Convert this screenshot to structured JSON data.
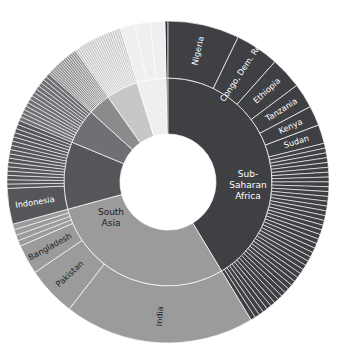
{
  "chart": {
    "type": "sunburst",
    "title": "",
    "subtitle": "",
    "center": {
      "cx": 168,
      "cy": 182
    },
    "radii": {
      "inner_hole": 48,
      "ring_boundary": 104,
      "outer": 161
    },
    "start_angle_deg": -90,
    "direction": "clockwise",
    "background": "#ffffff",
    "separator_color": "#ffffff",
    "colors": {
      "sub_saharan_africa": "#3f4044",
      "south_asia": "#9b9b9b",
      "east_asia_pacific": "#555659",
      "middle_east_north_africa": "#6f7073",
      "latin_america_caribbean": "#8a8b8d",
      "europe_central_asia": "#c7c7c7",
      "north_america": "#efefef",
      "other_small": "#2f3033"
    }
  },
  "chart_data": {
    "type": "pie",
    "title": "",
    "xlabel": "",
    "ylabel": "",
    "legend_position": "none",
    "grid": false,
    "inner_ring": {
      "name": "region",
      "categories": [
        "Sub-Saharan Africa",
        "South Asia",
        "East Asia & Pacific",
        "Middle East & North Africa",
        "Latin America & Caribbean",
        "Europe & Central Asia",
        "North America"
      ],
      "values": [
        41.5,
        29.5,
        10.5,
        5.5,
        3.5,
        5.0,
        4.5
      ],
      "labels_shown": [
        "Sub-Saharan Africa",
        "South Asia"
      ]
    },
    "outer_ring": {
      "name": "country",
      "labeled_segments": [
        {
          "label": "Nigeria",
          "parent": "Sub-Saharan Africa",
          "value": 7.2
        },
        {
          "label": "Congo, Dem. Rep.",
          "parent": "Sub-Saharan Africa",
          "value": 4.4
        },
        {
          "label": "Ethiopia",
          "parent": "Sub-Saharan Africa",
          "value": 3.2
        },
        {
          "label": "Tanzania",
          "parent": "Sub-Saharan Africa",
          "value": 2.5
        },
        {
          "label": "Kenya",
          "parent": "Sub-Saharan Africa",
          "value": 2.0
        },
        {
          "label": "Sudan",
          "parent": "Sub-Saharan Africa",
          "value": 1.9
        },
        {
          "label": "India",
          "parent": "South Asia",
          "value": 19.2
        },
        {
          "label": "Pakistan",
          "parent": "South Asia",
          "value": 5.0
        },
        {
          "label": "Bangladesh",
          "parent": "South Asia",
          "value": 3.0
        },
        {
          "label": "Indonesia",
          "parent": "East Asia & Pacific",
          "value": 3.6
        }
      ],
      "unlabeled_note": "remaining countries shown as thin unlabeled slices"
    }
  },
  "labels": {
    "nigeria": "Nigeria",
    "congo_dem_rep": "Congo, Dem. Rep.",
    "ethiopia": "Ethiopia",
    "tanzania": "Tanzania",
    "kenya": "Kenya",
    "sudan": "Sudan",
    "india": "India",
    "pakistan": "Pakistan",
    "bangladesh": "Bangladesh",
    "indonesia": "Indonesia",
    "sub_saharan_africa_line1": "Sub-",
    "sub_saharan_africa_line2": "Saharan",
    "sub_saharan_africa_line3": "Africa",
    "south_asia_line1": "South",
    "south_asia_line2": "Asia"
  }
}
